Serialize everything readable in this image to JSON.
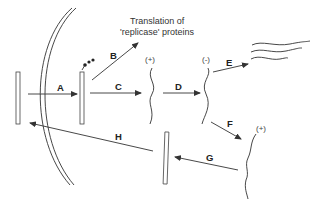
{
  "diagram": {
    "title_line1": "Translation of",
    "title_line2": "'replicase' proteins",
    "step_labels": {
      "A": "A",
      "B": "B",
      "C": "C",
      "D": "D",
      "E": "E",
      "F": "F",
      "G": "G",
      "H": "H"
    },
    "strand_signs": {
      "plus_first": "(+)",
      "minus": "(-)",
      "plus_second": "(+)"
    },
    "elements": [
      "outer-rna-rod",
      "cell-membrane-double-arc",
      "uncoated-rna-rod-with-ribosome",
      "plus-strand-rna",
      "minus-strand-rna",
      "progeny-rna-strands",
      "plus-strand-rna-copy",
      "assembled-rna-rod"
    ],
    "colors": {
      "line": "#333333",
      "background": "#ffffff"
    }
  }
}
